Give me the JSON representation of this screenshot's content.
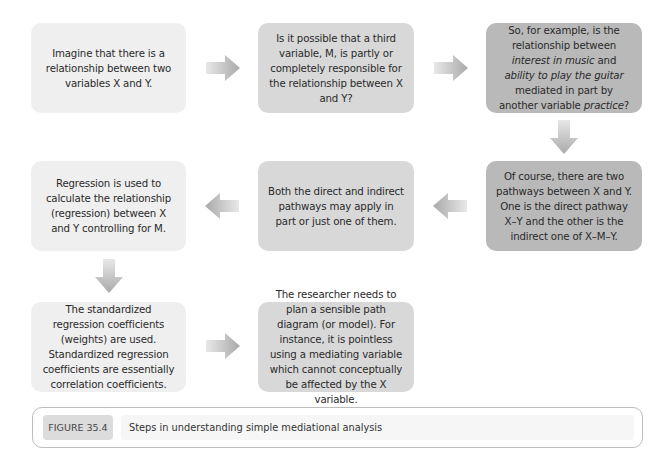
{
  "diagram": {
    "boxes": [
      {
        "id": "b1",
        "text": "Imagine that there is a relationship between two variables X and Y."
      },
      {
        "id": "b2",
        "text": "Is it possible that a third variable, M, is partly or completely responsible for the relationship between X and Y?"
      },
      {
        "id": "b3",
        "parts": [
          "So, for example, is the relationship between ",
          "interest in music",
          " and ",
          "ability to play the guitar",
          " mediated in part by another variable ",
          "practice",
          "?"
        ]
      },
      {
        "id": "b4",
        "text": "Of course, there are two pathways between X and Y. One is the direct pathway X–Y and the other is the indirect one of X–M–Y."
      },
      {
        "id": "b5",
        "text": "Both the direct and indirect pathways may apply in part or just one of them."
      },
      {
        "id": "b6",
        "text": "Regression is used to calculate the relationship (regression) between X and Y controlling for M."
      },
      {
        "id": "b7",
        "text": "The standardized regression coefficients (weights) are used. Standardized regression coefficients are essentially correlation coefficients."
      },
      {
        "id": "b8",
        "text": "The researcher needs to plan a sensible path diagram (or model). For instance, it is pointless using a mediating variable which cannot conceptually be affected by the X variable."
      }
    ],
    "arrows": [
      {
        "from": "b1",
        "to": "b2",
        "direction": "right"
      },
      {
        "from": "b2",
        "to": "b3",
        "direction": "right"
      },
      {
        "from": "b3",
        "to": "b4",
        "direction": "down"
      },
      {
        "from": "b4",
        "to": "b5",
        "direction": "left"
      },
      {
        "from": "b5",
        "to": "b6",
        "direction": "left"
      },
      {
        "from": "b6",
        "to": "b7",
        "direction": "down"
      },
      {
        "from": "b7",
        "to": "b8",
        "direction": "right"
      }
    ]
  },
  "caption": {
    "label": "FIGURE 35.4",
    "text": "Steps in understanding simple mediational analysis"
  }
}
